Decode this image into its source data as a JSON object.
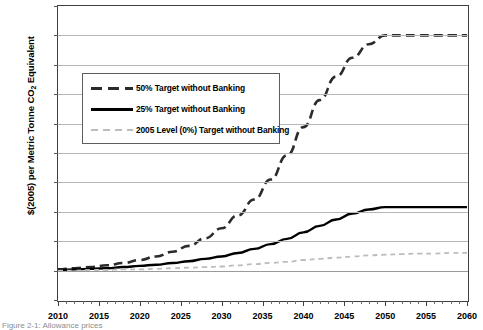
{
  "chart_data": {
    "type": "line",
    "title": "",
    "xlabel": "",
    "ylabel": "$(2005) per Metric Tonne CO2 Equivalent",
    "xlim": [
      2010,
      2060
    ],
    "ylim": [
      -50,
      450
    ],
    "ytick_step": 50,
    "xtick_step": 5,
    "xminor_step": 1,
    "grid": true,
    "legend_position": "upper left inside",
    "ytick_labels": [
      "$450.00",
      "$400.00",
      "$350.00",
      "$300.00",
      "$250.00",
      "$200.00",
      "$150.00",
      "$100.00",
      "$50.00",
      "$0.00",
      "-$50.00"
    ],
    "ytick_values": [
      450,
      400,
      350,
      300,
      250,
      200,
      150,
      100,
      50,
      0,
      -50
    ],
    "xtick_labels": [
      "2010",
      "2015",
      "2020",
      "2025",
      "2030",
      "2035",
      "2040",
      "2045",
      "2050",
      "2055",
      "2060"
    ],
    "xtick_values": [
      2010,
      2015,
      2020,
      2025,
      2030,
      2035,
      2040,
      2045,
      2050,
      2055,
      2060
    ],
    "x": [
      2010,
      2012,
      2014,
      2016,
      2018,
      2020,
      2022,
      2024,
      2026,
      2028,
      2030,
      2032,
      2034,
      2036,
      2038,
      2040,
      2042,
      2044,
      2046,
      2048,
      2050,
      2052,
      2054,
      2056,
      2058,
      2060
    ],
    "series": [
      {
        "name": "50% Target without Banking",
        "style": "dashed",
        "color": "#2b2b2b",
        "width": 2.6,
        "values": [
          2,
          4,
          6,
          9,
          13,
          18,
          24,
          32,
          42,
          55,
          72,
          94,
          121,
          155,
          196,
          244,
          290,
          330,
          362,
          385,
          400,
          400,
          400,
          400,
          400,
          400
        ]
      },
      {
        "name": "25% Target without Banking",
        "style": "solid",
        "color": "#000000",
        "width": 2.4,
        "values": [
          1,
          2,
          3,
          4,
          6,
          8,
          10,
          13,
          16,
          20,
          24,
          30,
          37,
          45,
          54,
          65,
          76,
          87,
          97,
          104,
          108,
          108,
          108,
          108,
          108,
          108
        ]
      },
      {
        "name": "2005 Level (0%) Target without Banking",
        "style": "dashed",
        "color": "#bcbcbc",
        "width": 1.8,
        "values": [
          0,
          0,
          1,
          1,
          2,
          2,
          3,
          4,
          5,
          6,
          7,
          9,
          11,
          13,
          15,
          18,
          20,
          22,
          24,
          26,
          27,
          28,
          29,
          29,
          30,
          30
        ]
      }
    ]
  },
  "legend": {
    "items": [
      {
        "label": "50% Target without Banking"
      },
      {
        "label": "25% Target without Banking"
      },
      {
        "label": "2005 Level (0%) Target without Banking"
      }
    ]
  },
  "caption": {
    "text": "Figure 2-1: Allowance prices"
  }
}
